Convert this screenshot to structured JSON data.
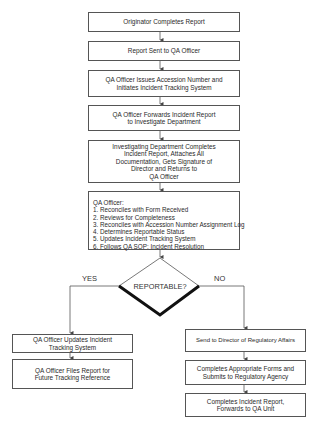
{
  "flowchart": {
    "main_steps": [
      {
        "lines": [
          "Originator Completes Report"
        ]
      },
      {
        "lines": [
          "Report Sent to QA Officer"
        ]
      },
      {
        "lines": [
          "QA Officer Issues Accession Number and",
          "Initiates Incident Tracking System"
        ]
      },
      {
        "lines": [
          "QA Officer Forwards Incident Report",
          "to Investigate Department"
        ]
      },
      {
        "lines": [
          "Investigating Department Completes",
          "Incident Report, Attaches All",
          "Documentation, Gets Signature of",
          "Director and Returns to",
          "QA Officer"
        ]
      }
    ],
    "qa_officer_box": {
      "title": "QA Officer:",
      "items": [
        "1. Reconciles with Form Received",
        "2. Reviews for Completeness",
        "3. Reconciles with Accession Number Assignment Log",
        "4. Determines Reportable Status",
        "5. Updates Incident Tracking System",
        "6. Follows QA SOP: Incident Resolution"
      ]
    },
    "decision": {
      "label": "REPORTABLE?",
      "yes_label": "YES",
      "no_label": "NO"
    },
    "yes_branch": [
      {
        "lines": [
          "QA Officer Updates Incident",
          "Tracking System"
        ]
      },
      {
        "lines": [
          "QA Officer Files Report for",
          "Future Tracking Reference"
        ]
      }
    ],
    "no_branch": [
      {
        "lines": [
          "Send to Director of Regulatory Affairs"
        ]
      },
      {
        "lines": [
          "Completes Appropriate Forms and",
          "Submits to Regulatory Agency"
        ]
      },
      {
        "lines": [
          "Completes Incident Report,",
          "Forwards to QA Unit"
        ]
      }
    ]
  }
}
